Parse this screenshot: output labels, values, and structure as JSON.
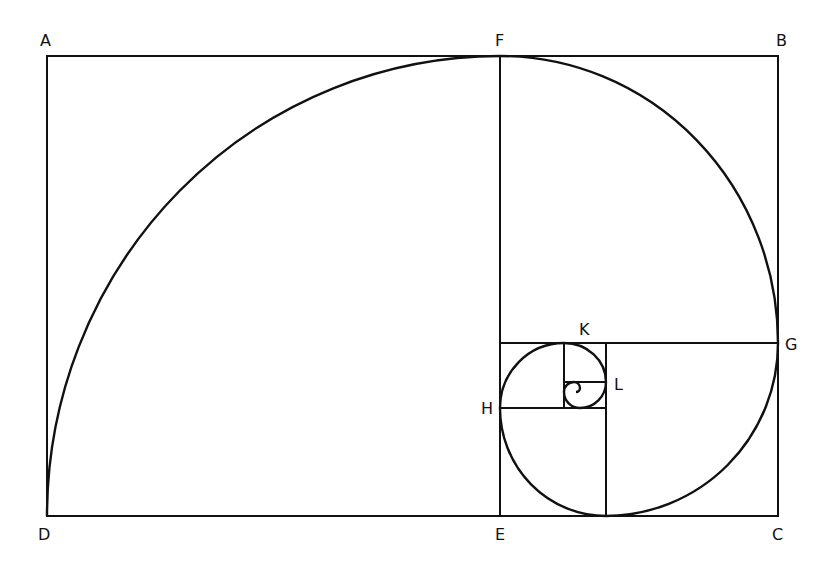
{
  "diagram": {
    "stroke_color": "#111111",
    "background": "#ffffff",
    "labels": {
      "A": "A",
      "B": "B",
      "C": "C",
      "D": "D",
      "E": "E",
      "F": "F",
      "G": "G",
      "H": "H",
      "K": "K",
      "L": "L"
    }
  }
}
